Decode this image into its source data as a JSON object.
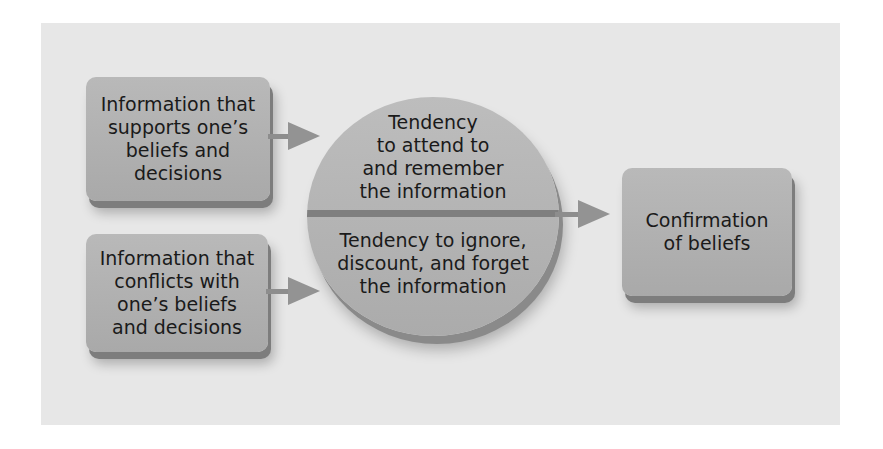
{
  "diagram": {
    "inputs": [
      {
        "label": "Information that\nsupports one’s\nbeliefs and\ndecisions"
      },
      {
        "label": "Information that\nconflicts with\none’s beliefs\nand decisions"
      }
    ],
    "process": {
      "top": "Tendency\nto attend to\nand remember\nthe information",
      "bottom": "Tendency to ignore,\ndiscount, and forget\nthe information"
    },
    "output": {
      "label": "Confirmation\nof beliefs"
    }
  },
  "colors": {
    "panel": "#e7e7e7",
    "box": "#b0b0b0",
    "arrow": "#8d8d8d"
  }
}
